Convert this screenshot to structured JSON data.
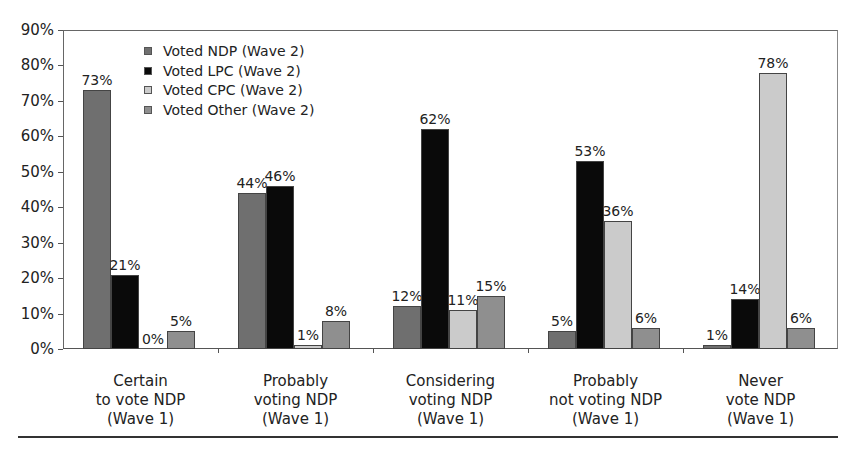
{
  "chart_data": {
    "type": "bar",
    "title": "",
    "xlabel": "",
    "ylabel": "",
    "ylim": [
      0,
      90
    ],
    "yticks": [
      "0%",
      "10%",
      "20%",
      "30%",
      "40%",
      "50%",
      "60%",
      "70%",
      "80%",
      "90%"
    ],
    "grid": false,
    "legend_position": "upper-left-inside",
    "categories": [
      [
        "Certain",
        "to vote NDP",
        "(Wave 1)"
      ],
      [
        "Probably",
        "voting NDP",
        "(Wave 1)"
      ],
      [
        "Considering",
        "voting NDP",
        "(Wave 1)"
      ],
      [
        "Probably",
        "not voting NDP",
        "(Wave 1)"
      ],
      [
        "Never",
        "vote NDP",
        "(Wave 1)"
      ]
    ],
    "series": [
      {
        "name": "Voted NDP (Wave 2)",
        "color": "#6f6f6f",
        "values": [
          73,
          44,
          12,
          5,
          1
        ]
      },
      {
        "name": "Voted LPC (Wave 2)",
        "color": "#0a0a0a",
        "values": [
          21,
          46,
          62,
          53,
          14
        ]
      },
      {
        "name": "Voted CPC (Wave 2)",
        "color": "#cbcbcb",
        "values": [
          0,
          1,
          11,
          36,
          78
        ]
      },
      {
        "name": "Voted Other (Wave 2)",
        "color": "#8f8f8f",
        "values": [
          5,
          8,
          15,
          6,
          6
        ]
      }
    ],
    "value_suffix": "%"
  }
}
